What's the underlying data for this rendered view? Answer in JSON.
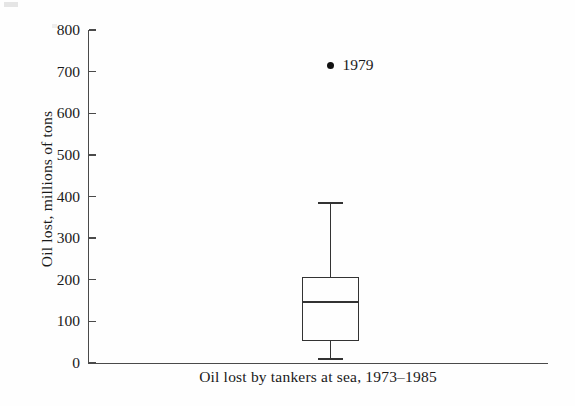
{
  "figure": {
    "background_color": "#fefefe",
    "ink_color": "#333333",
    "axis_color": "#4a4a4a"
  },
  "chart_data": {
    "type": "box",
    "title": "",
    "subtitle": "",
    "xlabel": "Oil lost by tankers at sea, 1973–1985",
    "ylabel": "Oil lost, millions of tons",
    "ylim": [
      0,
      800
    ],
    "ytick_labels": [
      "800",
      "700",
      "600",
      "500",
      "400",
      "300",
      "200",
      "100",
      "0"
    ],
    "ytick_values": [
      800,
      700,
      600,
      500,
      400,
      300,
      200,
      100,
      0
    ],
    "ytick_step": 100,
    "xtick_labels": [],
    "grid": false,
    "legend": false,
    "legend_position": "none",
    "categories": [
      "Oil lost by tankers at sea, 1973–1985"
    ],
    "boxes": [
      {
        "name": "Oil lost by tankers at sea, 1973–1985",
        "whisker_low": 10,
        "q1": 53,
        "median": 147,
        "q3": 207,
        "whisker_high": 385,
        "outliers": [
          {
            "value": 715,
            "label": "1979"
          }
        ]
      }
    ]
  },
  "axis": {
    "y_title": "Oil lost, millions of tons",
    "x_caption": "Oil lost by tankers at sea, 1973–1985",
    "ticks": [
      {
        "label": "800",
        "value": 800
      },
      {
        "label": "700",
        "value": 700
      },
      {
        "label": "600",
        "value": 600
      },
      {
        "label": "500",
        "value": 500
      },
      {
        "label": "400",
        "value": 400
      },
      {
        "label": "300",
        "value": 300
      },
      {
        "label": "200",
        "value": 200
      },
      {
        "label": "100",
        "value": 100
      },
      {
        "label": "0",
        "value": 0
      }
    ]
  },
  "annotations": {
    "outlier_year": "1979"
  }
}
